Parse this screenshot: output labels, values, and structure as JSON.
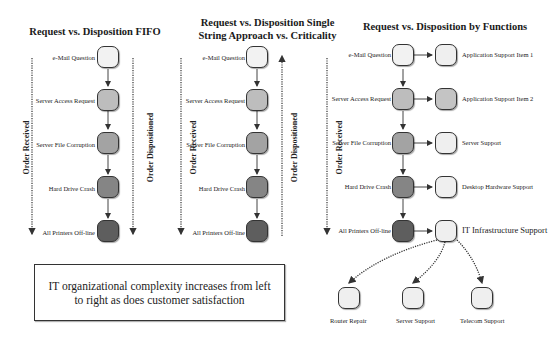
{
  "colors": {
    "level1": "#f2f2f2",
    "level2": "#bdbdbd",
    "level3": "#a3a3a3",
    "level4": "#858585",
    "level5": "#5e5e5e",
    "function_box": "#efefef",
    "border": "#333333"
  },
  "panels": [
    {
      "title_line1": "Request vs. Disposition FIFO",
      "title_line2": "",
      "left_axis_label": "Order Received",
      "right_axis_label": "Order Dispositioned",
      "right_axis_direction": "down",
      "requests": [
        "e-Mail Question",
        "Server Access Request",
        "Server File Corruption",
        "Hard Drive Crash",
        "All Printers Off-line"
      ]
    },
    {
      "title_line1": "Request vs. Disposition Single",
      "title_line2": "String Approach vs. Criticality",
      "left_axis_label": "Order Received",
      "right_axis_label": "Order Dispositioned",
      "right_axis_direction": "up",
      "requests": [
        "e-Mail Question",
        "Server Access Request",
        "Server File Corruption",
        "Hard Drive Crash",
        "All Printers Off-line"
      ]
    },
    {
      "title_line1": "Request vs. Disposition by Functions",
      "title_line2": "",
      "left_axis_label": "Order Received",
      "requests": [
        "e-Mail Question",
        "Server Access Request",
        "Server File Corruption",
        "Hard Drive Crash",
        "All Printers Off-line"
      ],
      "functions": [
        "Application Support Item 1",
        "Application Support Item 2",
        "Server Support",
        "Desktop Hardware Support",
        "IT Infrastructure Support"
      ],
      "sub_functions": [
        "Router Repair",
        "Server Support",
        "Telecom Support"
      ]
    }
  ],
  "note": "IT organizational complexity increases from left to right as does customer satisfaction"
}
